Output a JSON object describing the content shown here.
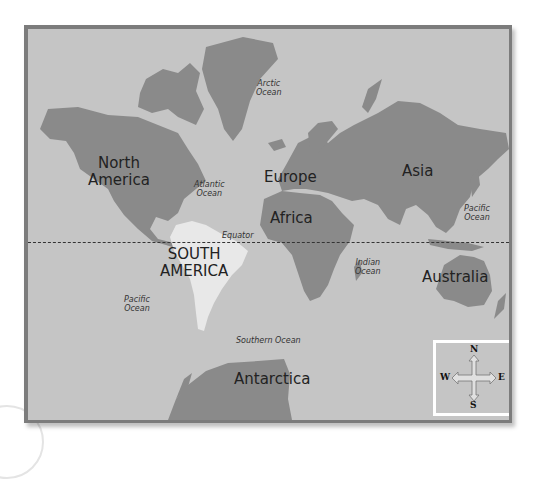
{
  "map": {
    "title": "World Map",
    "colors": {
      "ocean": "#c5c5c5",
      "land": "#8a8a8a",
      "highlight_land": "#e8e8e8",
      "frame": "#7c7c7c"
    },
    "continents": [
      {
        "id": "north-america",
        "label": "North America",
        "line1": "North",
        "line2": "America"
      },
      {
        "id": "south-america",
        "label": "SOUTH AMERICA",
        "line1": "SOUTH",
        "line2": "AMERICA",
        "highlighted": true
      },
      {
        "id": "europe",
        "label": "Europe"
      },
      {
        "id": "africa",
        "label": "Africa"
      },
      {
        "id": "asia",
        "label": "Asia"
      },
      {
        "id": "australia",
        "label": "Australia"
      },
      {
        "id": "antarctica",
        "label": "Antarctica"
      }
    ],
    "oceans": [
      {
        "id": "arctic",
        "line1": "Arctic",
        "line2": "Ocean"
      },
      {
        "id": "atlantic",
        "line1": "Atlantic",
        "line2": "Ocean"
      },
      {
        "id": "pacific-east",
        "line1": "Pacific",
        "line2": "Ocean"
      },
      {
        "id": "pacific-west",
        "line1": "Pacific",
        "line2": "Ocean"
      },
      {
        "id": "indian",
        "line1": "Indian",
        "line2": "Ocean"
      },
      {
        "id": "southern",
        "label": "Southern Ocean"
      }
    ],
    "equator_label": "Equator",
    "compass": {
      "n": "N",
      "s": "S",
      "e": "E",
      "w": "W"
    }
  }
}
